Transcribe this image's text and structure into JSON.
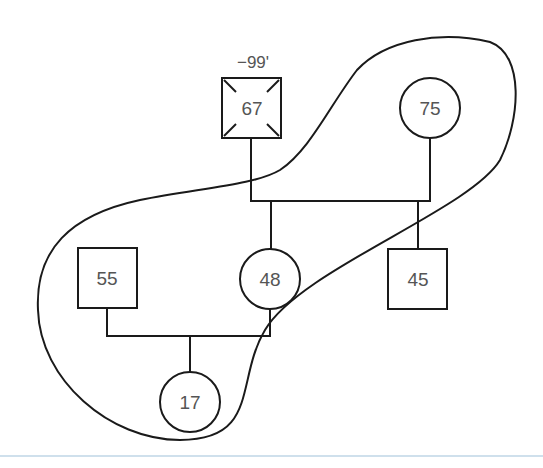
{
  "diagram": {
    "type": "pedigree-genogram",
    "annotation": "−99'",
    "nodes": [
      {
        "id": "grandfather",
        "shape": "square",
        "label": "67",
        "deceased_marker": true
      },
      {
        "id": "grandmother",
        "shape": "circle",
        "label": "75"
      },
      {
        "id": "son-in-law",
        "shape": "square",
        "label": "55"
      },
      {
        "id": "daughter",
        "shape": "circle",
        "label": "48"
      },
      {
        "id": "son",
        "shape": "square",
        "label": "45"
      },
      {
        "id": "granddaughter",
        "shape": "circle",
        "label": "17"
      }
    ],
    "enclosure": "household-boundary",
    "colors": {
      "line": "#1a1a1a",
      "text": "#555555",
      "rule": "#cfe0ec"
    }
  }
}
